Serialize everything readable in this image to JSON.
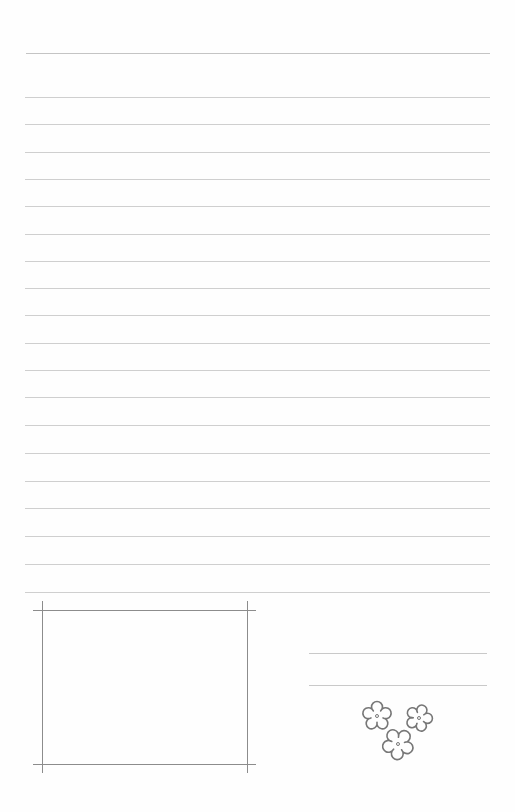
{
  "document": {
    "type": "lined letter paper",
    "colors": {
      "paper": "#fefefe",
      "rule_line": "#cfcfcf",
      "frame_line": "#8c8c8c",
      "flower_outline": "#777777"
    },
    "top_rule": {
      "y": 53,
      "x1": 26,
      "x2": 490
    },
    "rules": {
      "x1": 25,
      "x2": 490,
      "y_positions": [
        97,
        124,
        152,
        179,
        206,
        234,
        261,
        288,
        315,
        343,
        370,
        397,
        425,
        453,
        481,
        508,
        536,
        564,
        592
      ]
    },
    "photo_frame": {
      "horizontal_lines": [
        {
          "y": 610,
          "x1": 33,
          "x2": 256
        },
        {
          "y": 764,
          "x1": 33,
          "x2": 256
        }
      ],
      "vertical_lines": [
        {
          "x": 42,
          "y1": 601,
          "y2": 773
        },
        {
          "x": 247,
          "y1": 601,
          "y2": 773
        }
      ]
    },
    "signature_lines": [
      {
        "y": 653,
        "x1": 309,
        "x2": 487
      },
      {
        "y": 685,
        "x1": 309,
        "x2": 487
      }
    ],
    "decoration": {
      "icon": "flower-cluster-icon",
      "flowers": [
        {
          "cx": 377,
          "cy": 716,
          "r": 13
        },
        {
          "cx": 419,
          "cy": 718,
          "r": 12
        },
        {
          "cx": 398,
          "cy": 744,
          "r": 14
        }
      ]
    }
  }
}
